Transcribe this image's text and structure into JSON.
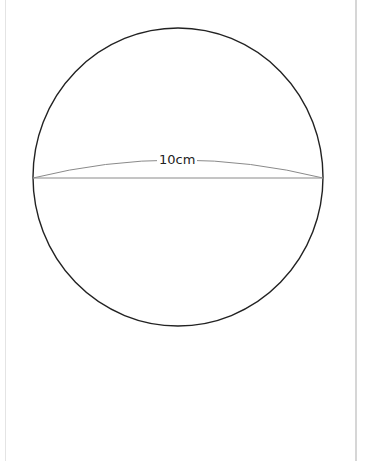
{
  "diagram": {
    "type": "sphere",
    "shape": {
      "cx": 178,
      "cy": 177,
      "rx": 145,
      "ry": 149,
      "stroke": "#222222"
    },
    "equator": {
      "y": 178,
      "arc_peak_y": 160,
      "arc_color": "#8a8a8a",
      "line_color": "#8a8a8a"
    },
    "diameter_label": "10cm"
  }
}
